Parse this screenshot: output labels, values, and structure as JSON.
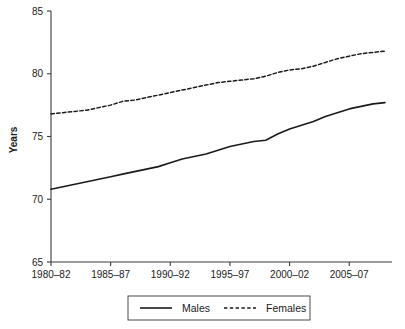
{
  "chart_data": {
    "type": "line",
    "title": "",
    "subtitle": "",
    "xlabel": "",
    "ylabel": "Years",
    "ylim": [
      65,
      85
    ],
    "yticks": [
      65,
      70,
      75,
      80,
      85
    ],
    "ytick_labels": [
      "65",
      "70",
      "75",
      "80",
      "85"
    ],
    "grid": false,
    "legend_position": "bottom-center",
    "categories": [
      "1980–82",
      "1981–83",
      "1982–84",
      "1983–85",
      "1984–86",
      "1985–87",
      "1986–88",
      "1987–89",
      "1988–90",
      "1989–91",
      "1990–92",
      "1991–93",
      "1992–94",
      "1993–95",
      "1994–96",
      "1995–97",
      "1996–98",
      "1997–99",
      "1998–2000",
      "1999–01",
      "2000–02",
      "2001–03",
      "2002–04",
      "2003–05",
      "2004–06",
      "2005–07",
      "2006–08",
      "2007–09",
      "2008–10"
    ],
    "xtick_labels": [
      "1980–82",
      "1985–87",
      "1990–92",
      "1995–97",
      "2000–02",
      "2005–07"
    ],
    "xtick_categories": [
      "1980–82",
      "1985–87",
      "1990–92",
      "1995–97",
      "2000–02",
      "2005–07"
    ],
    "series": [
      {
        "name": "Males",
        "style": "solid",
        "color": "#1a1a1a",
        "values": [
          70.8,
          71.0,
          71.2,
          71.4,
          71.6,
          71.8,
          72.0,
          72.2,
          72.4,
          72.6,
          72.9,
          73.2,
          73.4,
          73.6,
          73.9,
          74.2,
          74.4,
          74.6,
          74.7,
          75.2,
          75.6,
          75.9,
          76.2,
          76.6,
          76.9,
          77.2,
          77.4,
          77.6,
          77.7
        ]
      },
      {
        "name": "Females",
        "style": "dashed",
        "color": "#1a1a1a",
        "values": [
          76.8,
          76.9,
          77.0,
          77.1,
          77.3,
          77.5,
          77.8,
          77.9,
          78.1,
          78.3,
          78.5,
          78.7,
          78.9,
          79.1,
          79.3,
          79.4,
          79.5,
          79.6,
          79.8,
          80.1,
          80.3,
          80.4,
          80.6,
          80.9,
          81.2,
          81.4,
          81.6,
          81.7,
          81.8
        ]
      }
    ]
  },
  "axes": {
    "y_title": "Years"
  },
  "legend": {
    "entries": [
      {
        "label": "Males",
        "style": "solid"
      },
      {
        "label": "Females",
        "style": "dashed"
      }
    ]
  }
}
